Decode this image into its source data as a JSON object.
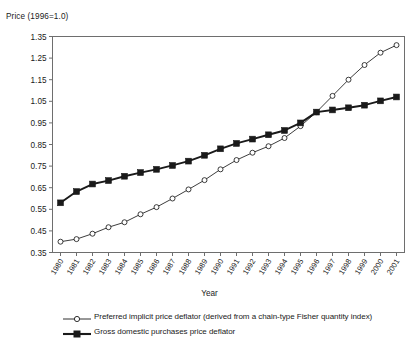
{
  "chart_data": {
    "type": "line",
    "title": "",
    "ylabel": "Price (1996=1.0)",
    "xlabel": "Year",
    "grid": false,
    "legend_position": "bottom-left",
    "ylim": [
      0.35,
      1.35
    ],
    "ytick_step": 0.1,
    "yticks": [
      "0.35",
      "0.45",
      "0.55",
      "0.65",
      "0.75",
      "0.85",
      "0.95",
      "1.05",
      "1.15",
      "1.25",
      "1.35"
    ],
    "categories": [
      "1980",
      "1981",
      "1982",
      "1983",
      "1984",
      "1985",
      "1986",
      "1987",
      "1988",
      "1989",
      "1990",
      "1991",
      "1992",
      "1993",
      "1994",
      "1995",
      "1996",
      "1997",
      "1998",
      "1999",
      "2000",
      "2001"
    ],
    "series": [
      {
        "name": "Preferred implicit price deflator (derived from a chain-type Fisher quantity index)",
        "marker": "open-circle",
        "line_weight": "thin",
        "values": [
          0.4,
          0.412,
          0.437,
          0.467,
          0.49,
          0.527,
          0.56,
          0.6,
          0.642,
          0.685,
          0.735,
          0.778,
          0.812,
          0.842,
          0.88,
          0.935,
          1.0,
          1.075,
          1.15,
          1.218,
          1.275,
          1.31
        ]
      },
      {
        "name": "Gross domestic purchases price deflator",
        "marker": "filled-square",
        "line_weight": "thick",
        "values": [
          0.58,
          0.632,
          0.667,
          0.683,
          0.703,
          0.72,
          0.735,
          0.753,
          0.773,
          0.8,
          0.83,
          0.855,
          0.875,
          0.895,
          0.915,
          0.95,
          1.0,
          1.01,
          1.02,
          1.032,
          1.052,
          1.07
        ]
      }
    ]
  },
  "legend": {
    "items": [
      {
        "label": "Preferred implicit price deflator (derived from a chain-type Fisher quantity index)",
        "marker": "open-circle"
      },
      {
        "label": "Gross domestic purchases price deflator",
        "marker": "filled-square"
      }
    ]
  },
  "caption_fragment": ""
}
